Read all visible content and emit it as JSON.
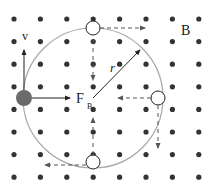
{
  "diagram": {
    "field_label": "B",
    "velocity_label": "v",
    "force_label": "F",
    "force_subscript": "B",
    "radius_label": "r",
    "field_direction": "out-of-page (dots)",
    "grid": {
      "rows": 8,
      "cols": 8
    },
    "colors": {
      "dot": "#333333",
      "orbit": "#a8a8a8",
      "particle": "#6b6b6b",
      "arrow": "#222222",
      "dashed_arrow": "#555555"
    },
    "positions_on_orbit": [
      {
        "name": "left",
        "role": "particle",
        "velocity": "up",
        "force": "toward-center"
      },
      {
        "name": "top",
        "role": "ghost",
        "velocity": "right",
        "force": "down"
      },
      {
        "name": "right",
        "role": "ghost",
        "velocity": "down",
        "force": "left"
      },
      {
        "name": "bottom",
        "role": "ghost",
        "velocity": "left",
        "force": "up"
      }
    ]
  }
}
